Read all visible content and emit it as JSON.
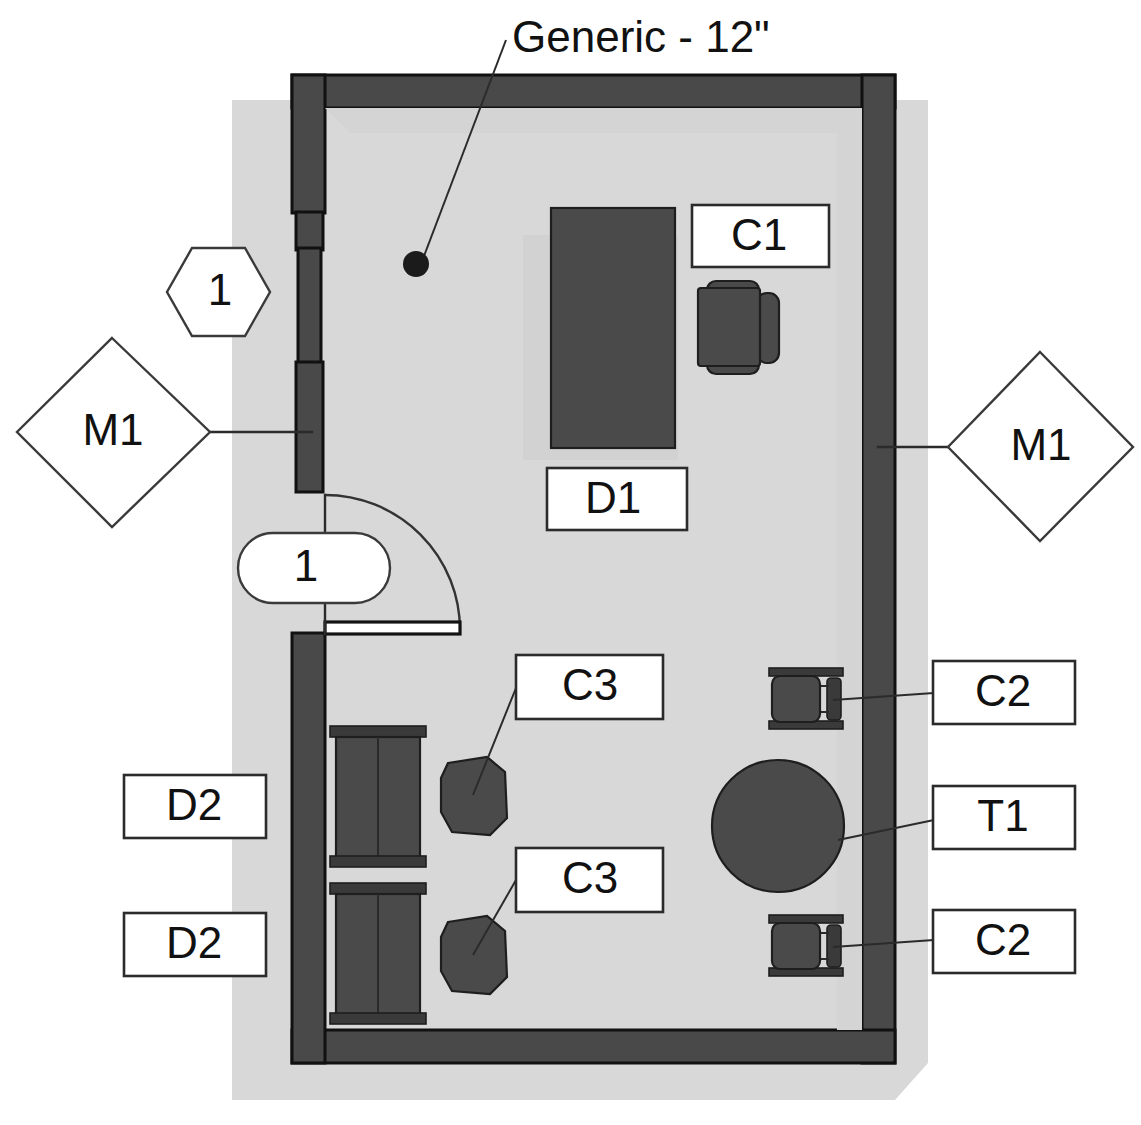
{
  "drawing": {
    "type": "architectural-floor-plan",
    "title": "Generic - 12\"",
    "background_color": "#ffffff",
    "wall_color": "#494949",
    "furniture_color": "#4d4d4d",
    "shadow_color": "#d8d8d8",
    "outline_color": "#2b2b2b"
  },
  "title_label": {
    "text": "Generic - 12\"",
    "leader_dot": {
      "x": 416,
      "y": 264
    }
  },
  "tags": {
    "hex_window": {
      "label": "1",
      "shape": "hexagon"
    },
    "door_tag": {
      "label": "1",
      "shape": "stadium"
    },
    "mount_left": {
      "label": "M1",
      "shape": "diamond"
    },
    "mount_right": {
      "label": "M1",
      "shape": "diamond"
    }
  },
  "furniture_labels": [
    {
      "code": "C1",
      "item": "chair-c1",
      "shape": "rect-callout"
    },
    {
      "code": "D1",
      "item": "desk-d1",
      "shape": "rect-callout"
    },
    {
      "code": "C2",
      "item": "chair-c2-upper",
      "shape": "rect-callout"
    },
    {
      "code": "T1",
      "item": "table-t1",
      "shape": "rect-callout"
    },
    {
      "code": "C2",
      "item": "chair-c2-lower",
      "shape": "rect-callout"
    },
    {
      "code": "C3",
      "item": "chair-c3-upper",
      "shape": "rect-callout"
    },
    {
      "code": "C3",
      "item": "chair-c3-lower",
      "shape": "rect-callout"
    },
    {
      "code": "D2",
      "item": "cabinet-d2-upper",
      "shape": "rect-callout"
    },
    {
      "code": "D2",
      "item": "cabinet-d2-lower",
      "shape": "rect-callout"
    }
  ],
  "legend_codes": {
    "C1": "C1",
    "C2": "C2",
    "C3": "C3",
    "D1": "D1",
    "D2": "D2",
    "T1": "T1",
    "M1": "M1",
    "one": "1"
  }
}
